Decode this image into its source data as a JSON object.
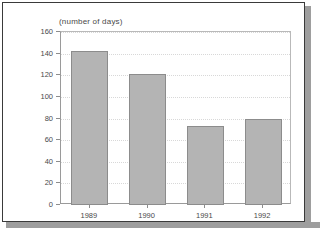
{
  "chart_data": {
    "type": "bar",
    "title": "(number of days)",
    "xlabel": "",
    "ylabel": "",
    "categories": [
      "1989",
      "1990",
      "1991",
      "1992"
    ],
    "values": [
      142,
      121,
      73,
      80
    ],
    "ylim": [
      0,
      160
    ],
    "yticks": [
      0,
      20,
      40,
      60,
      80,
      100,
      120,
      140,
      160
    ],
    "ytick_labels": [
      "0",
      "20",
      "40",
      "60",
      "80",
      "100",
      "120",
      "140",
      "160"
    ],
    "grid": true,
    "legend": null,
    "bar_color": "#b4b4b4",
    "bar_edge_color": "#8c8c8c",
    "grid_color": "#d8d8d8",
    "axis_color": "#9a9a9a",
    "text_color": "#4a4a4a",
    "background": "#ffffff",
    "frame_color": "#3a3a3a",
    "shadow_color": "#9e9e9e"
  }
}
